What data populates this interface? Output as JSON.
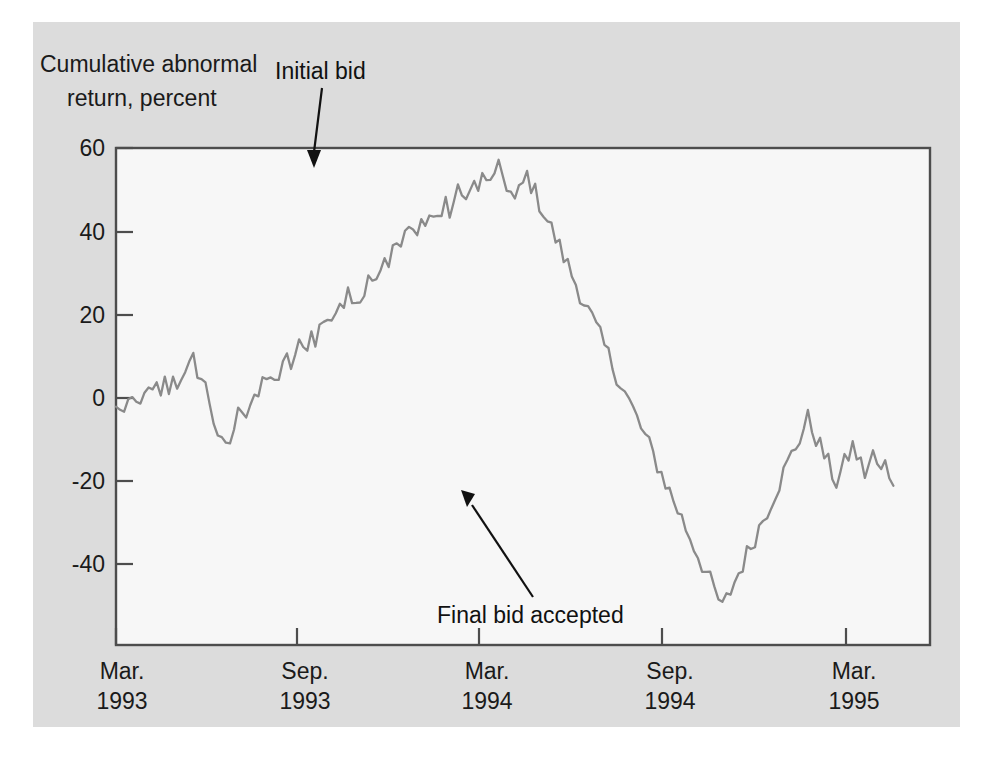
{
  "figure": {
    "panel_background": "#dcdcdc",
    "plot_background": "#f7f7f7",
    "frame_color": "#4d4d4d",
    "series_color": "#8a8a8a",
    "text_color": "#1a1a1a"
  },
  "axis": {
    "y_title_line1": "Cumulative abnormal",
    "y_title_line2": "return, percent",
    "y_ticks": [
      "60",
      "40",
      "20",
      "0",
      "-20",
      "-40"
    ],
    "x_ticks": [
      {
        "month": "Mar.",
        "year": "1993"
      },
      {
        "month": "Sep.",
        "year": "1993"
      },
      {
        "month": "Mar.",
        "year": "1994"
      },
      {
        "month": "Sep.",
        "year": "1994"
      },
      {
        "month": "Mar.",
        "year": "1995"
      }
    ]
  },
  "annotations": [
    {
      "label": "Initial bid"
    },
    {
      "label": "Final bid accepted"
    }
  ],
  "chart_data": {
    "type": "line",
    "title": "",
    "xlabel": "",
    "ylabel": "Cumulative abnormal return, percent",
    "ylim": [
      -50,
      60
    ],
    "yticks": [
      -40,
      -20,
      0,
      20,
      40,
      60
    ],
    "xlim": [
      "1993-03",
      "1995-06"
    ],
    "xtick_labels": [
      "Mar. 1993",
      "Sep. 1993",
      "Mar. 1994",
      "Sep. 1994",
      "Mar. 1995"
    ],
    "grid": false,
    "legend": "none",
    "annotations": [
      {
        "text": "Initial bid",
        "points_to_x_fraction": 0.243,
        "points_to_value": 52
      },
      {
        "text": "Final bid accepted",
        "points_to_x_fraction": 0.435,
        "points_to_value": -26
      }
    ],
    "series": [
      {
        "name": "Cumulative abnormal return",
        "x_fraction": [
          0.0,
          0.005,
          0.01,
          0.015,
          0.02,
          0.025,
          0.03,
          0.035,
          0.04,
          0.045,
          0.05,
          0.055,
          0.06,
          0.065,
          0.07,
          0.075,
          0.08,
          0.085,
          0.09,
          0.095,
          0.1,
          0.105,
          0.11,
          0.115,
          0.12,
          0.125,
          0.13,
          0.135,
          0.14,
          0.145,
          0.15,
          0.155,
          0.16,
          0.165,
          0.17,
          0.175,
          0.18,
          0.185,
          0.19,
          0.195,
          0.2,
          0.205,
          0.21,
          0.215,
          0.22,
          0.225,
          0.23,
          0.235,
          0.24,
          0.245,
          0.25,
          0.255,
          0.26,
          0.265,
          0.27,
          0.275,
          0.28,
          0.285,
          0.29,
          0.295,
          0.3,
          0.305,
          0.31,
          0.315,
          0.32,
          0.325,
          0.33,
          0.335,
          0.34,
          0.345,
          0.35,
          0.355,
          0.36,
          0.365,
          0.37,
          0.375,
          0.38,
          0.385,
          0.39,
          0.395,
          0.4,
          0.405,
          0.41,
          0.415,
          0.42,
          0.425,
          0.43,
          0.435,
          0.44,
          0.445,
          0.45,
          0.455,
          0.46,
          0.465,
          0.47,
          0.475,
          0.48,
          0.485,
          0.49,
          0.495,
          0.5,
          0.505,
          0.51,
          0.515,
          0.52,
          0.525,
          0.53,
          0.535,
          0.54,
          0.545,
          0.55,
          0.555,
          0.56,
          0.565,
          0.57,
          0.575,
          0.58,
          0.585,
          0.59,
          0.595,
          0.6,
          0.605,
          0.61,
          0.615,
          0.62,
          0.625,
          0.63,
          0.635,
          0.64,
          0.645,
          0.65,
          0.655,
          0.66,
          0.665,
          0.67,
          0.675,
          0.68,
          0.685,
          0.69,
          0.695,
          0.7,
          0.705,
          0.71,
          0.715,
          0.72,
          0.725,
          0.73,
          0.735,
          0.74,
          0.745,
          0.75,
          0.755,
          0.76,
          0.765,
          0.77,
          0.775,
          0.78,
          0.785,
          0.79,
          0.795,
          0.8,
          0.805,
          0.81,
          0.815,
          0.82,
          0.825,
          0.83,
          0.835,
          0.84,
          0.845,
          0.85,
          0.855,
          0.86,
          0.865,
          0.87,
          0.875,
          0.88,
          0.885,
          0.89,
          0.895,
          0.9,
          0.905,
          0.91,
          0.915,
          0.92,
          0.925,
          0.93,
          0.935,
          0.94,
          0.945,
          0.95,
          0.955,
          0.96,
          0.965,
          0.97,
          0.975,
          0.98,
          0.985,
          0.99,
          0.995,
          1.0
        ],
        "values": [
          2,
          3,
          1,
          2,
          4,
          3,
          5,
          4,
          6,
          5,
          7,
          6,
          8,
          7,
          9,
          8,
          10,
          9,
          11,
          13,
          11,
          9,
          7,
          4,
          0,
          -3,
          -6,
          -7,
          -5,
          -2,
          1,
          3,
          2,
          4,
          6,
          5,
          7,
          9,
          8,
          10,
          9,
          11,
          13,
          12,
          14,
          16,
          15,
          17,
          19,
          18,
          20,
          22,
          21,
          23,
          24,
          26,
          25,
          27,
          26,
          28,
          27,
          29,
          31,
          33,
          32,
          34,
          36,
          35,
          37,
          39,
          38,
          40,
          42,
          41,
          43,
          44,
          43,
          45,
          44,
          46,
          45,
          47,
          46,
          48,
          50,
          49,
          51,
          50,
          52,
          51,
          53,
          52,
          54,
          53,
          55,
          54,
          52,
          50,
          48,
          50,
          52,
          54,
          52,
          50,
          48,
          46,
          44,
          42,
          40,
          38,
          36,
          34,
          32,
          30,
          28,
          26,
          24,
          22,
          20,
          18,
          16,
          14,
          12,
          10,
          8,
          6,
          4,
          2,
          0,
          -2,
          -4,
          -6,
          -8,
          -10,
          -12,
          -14,
          -16,
          -18,
          -20,
          -22,
          -24,
          -26,
          -28,
          -30,
          -32,
          -34,
          -36,
          -38,
          -40,
          -42,
          -40,
          -38,
          -36,
          -34,
          -32,
          -30,
          -28,
          -26,
          -24,
          -22,
          -20,
          -18,
          -16,
          -14,
          -12,
          -10,
          -8,
          -6,
          -4,
          -2,
          0,
          -2,
          -4,
          -6,
          -8,
          -10,
          -12,
          -14,
          -12,
          -10,
          -8,
          -6,
          -8,
          -10,
          -12,
          -10,
          -8,
          -10,
          -12,
          -10,
          -12,
          -13
        ]
      }
    ],
    "described_shape": "Starts near 0 in Mar 1993, small rise to about 13 then a dip to about -7, then a sustained climb through mid-1993 reaching a peak near 55 just before the initial bid (Sep 1993), followed by a volatile decline through early 1994 to a trough near -43 just after the final bid accepted (Mar 1994), then a gradual recovery through 1994 to roughly 0 by Mar 1995, ending near -13 in mid-1995."
  }
}
